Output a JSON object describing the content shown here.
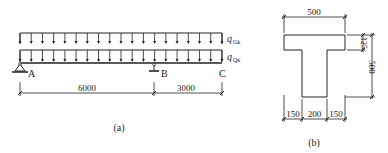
{
  "figure_a": {
    "caption": "(a)",
    "loads": {
      "top": {
        "symbol": "q",
        "subscript": "Gk"
      },
      "bottom": {
        "symbol": "q",
        "subscript": "Qk"
      }
    },
    "points": {
      "A": "A",
      "B": "B",
      "C": "C"
    },
    "dimensions": {
      "span_AB": "6000",
      "overhang_BC": "3000"
    }
  },
  "figure_b": {
    "caption": "(b)",
    "dimensions": {
      "flange_width": "500",
      "flange_thickness": "125",
      "total_height": "500",
      "left_overhang": "150",
      "web_width": "200",
      "right_overhang": "150"
    }
  },
  "colors": {
    "line": "#222222",
    "background": "#ffffff"
  }
}
